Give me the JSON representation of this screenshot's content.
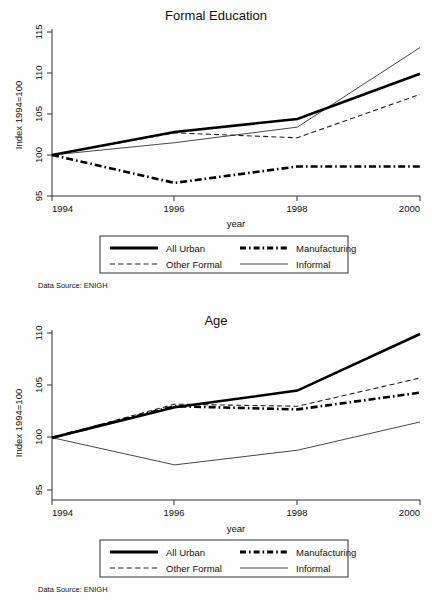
{
  "figure": {
    "width": 432,
    "height": 606,
    "note": "Data Source: ENIGH",
    "legend": {
      "entries": [
        {
          "key": "all_urban",
          "label": "All Urban",
          "style": "thick-solid"
        },
        {
          "key": "manufacturing",
          "label": "Manufacturing",
          "style": "thick-dash-dot"
        },
        {
          "key": "other_formal",
          "label": "Other Formal",
          "style": "thin-dashed"
        },
        {
          "key": "informal",
          "label": "Informal",
          "style": "thin-solid"
        }
      ]
    }
  },
  "chart_data": [
    {
      "type": "line",
      "title": "Formal Education",
      "xlabel": "year",
      "ylabel": "Index 1994=100",
      "x": [
        1994,
        1996,
        1998,
        2000
      ],
      "xticks": [
        "1994",
        "1996",
        "1998",
        "2000"
      ],
      "yticks": [
        "95",
        "100",
        "105",
        "110",
        "115"
      ],
      "xlim": [
        1994,
        2000
      ],
      "ylim": [
        95,
        115
      ],
      "grid": false,
      "legend_position": "below",
      "note": "Data Source: ENIGH",
      "series": [
        {
          "name": "All Urban",
          "key": "all_urban",
          "values": [
            100.0,
            102.8,
            104.4,
            109.9
          ]
        },
        {
          "name": "Manufacturing",
          "key": "manufacturing",
          "values": [
            100.0,
            96.6,
            98.6,
            98.6
          ]
        },
        {
          "name": "Other Formal",
          "key": "other_formal",
          "values": [
            100.0,
            102.7,
            102.1,
            107.4
          ]
        },
        {
          "name": "Informal",
          "key": "informal",
          "values": [
            100.0,
            101.5,
            103.4,
            113.1
          ]
        }
      ]
    },
    {
      "type": "line",
      "title": "Age",
      "xlabel": "year",
      "ylabel": "Index 1994=100",
      "x": [
        1994,
        1996,
        1998,
        2000
      ],
      "xticks": [
        "1994",
        "1996",
        "1998",
        "2000"
      ],
      "yticks": [
        "95",
        "100",
        "105",
        "110"
      ],
      "xlim": [
        1994,
        2000
      ],
      "ylim": [
        94,
        111
      ],
      "grid": false,
      "legend_position": "below",
      "note": "Data Source: ENIGH",
      "series": [
        {
          "name": "All Urban",
          "key": "all_urban",
          "values": [
            100.0,
            102.9,
            104.5,
            109.9
          ]
        },
        {
          "name": "Manufacturing",
          "key": "manufacturing",
          "values": [
            100.0,
            103.0,
            102.7,
            104.3
          ]
        },
        {
          "name": "Other Formal",
          "key": "other_formal",
          "values": [
            100.0,
            103.2,
            103.0,
            105.7
          ]
        },
        {
          "name": "Informal",
          "key": "informal",
          "values": [
            100.0,
            97.4,
            98.8,
            101.5
          ]
        }
      ]
    }
  ]
}
